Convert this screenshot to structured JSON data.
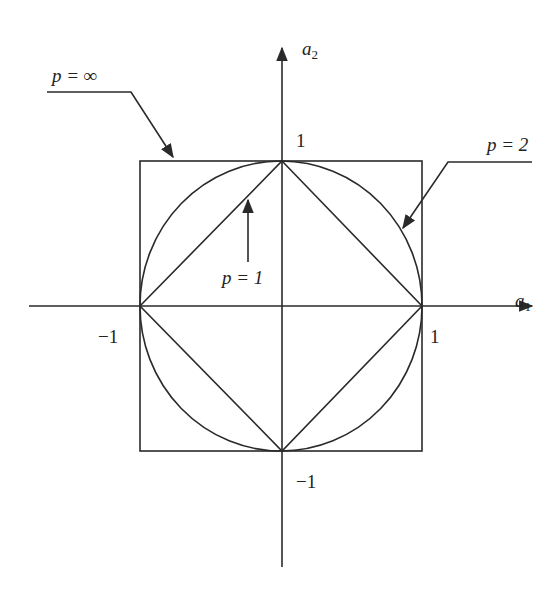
{
  "diagram": {
    "type": "unit-ball-norms",
    "axes": {
      "x_label": "a",
      "x_label_sub": "1",
      "y_label": "a",
      "y_label_sub": "2"
    },
    "ticks": {
      "x_pos": "1",
      "x_neg": "−1",
      "y_pos": "1",
      "y_neg": "−1"
    },
    "curves": [
      {
        "id": "p_inf",
        "label": "p = ∞",
        "shape": "square"
      },
      {
        "id": "p_2",
        "label": "p = 2",
        "shape": "circle"
      },
      {
        "id": "p_1",
        "label": "p = 1",
        "shape": "diamond"
      }
    ],
    "colors": {
      "line": "#2a2a2a",
      "background": "#ffffff"
    }
  }
}
